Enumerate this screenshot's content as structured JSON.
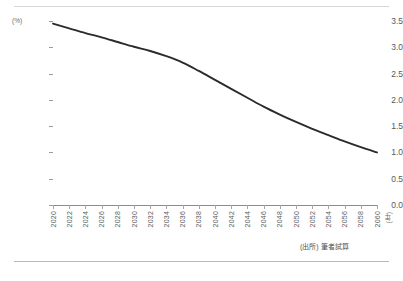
{
  "chart_data": {
    "type": "line",
    "title": "",
    "xlabel": "(年)",
    "ylabel": "(%)",
    "ylim": [
      0.0,
      3.5
    ],
    "xlim": [
      2020,
      2060
    ],
    "grid": false,
    "legend": "none",
    "y_ticks": [
      "0.0",
      "0.5",
      "1.0",
      "1.5",
      "2.0",
      "2.5",
      "3.0",
      "3.5"
    ],
    "y_tick_values": [
      0.0,
      0.5,
      1.0,
      1.5,
      2.0,
      2.5,
      3.0,
      3.5
    ],
    "categories": [
      "2020",
      "2022",
      "2024",
      "2026",
      "2028",
      "2030",
      "2032",
      "2034",
      "2036",
      "2038",
      "2040",
      "2042",
      "2044",
      "2046",
      "2048",
      "2050",
      "2052",
      "2054",
      "2056",
      "2058",
      "2060"
    ],
    "series": [
      {
        "name": "筆者試算",
        "values": [
          3.45,
          3.36,
          3.27,
          3.19,
          3.1,
          3.01,
          2.93,
          2.83,
          2.71,
          2.55,
          2.38,
          2.21,
          2.04,
          1.87,
          1.72,
          1.58,
          1.45,
          1.33,
          1.21,
          1.1,
          1.0
        ]
      }
    ],
    "annotations": []
  },
  "axis": {
    "y_unit": "(%)",
    "x_unit": "(年)"
  },
  "footnote": {
    "source": "(出所) 筆者試算"
  },
  "colors": {
    "line": "#2b2b2b",
    "axis": "#8c8c8c",
    "rule": "#c4c4c4",
    "text": "#555555",
    "background": "#ffffff"
  }
}
